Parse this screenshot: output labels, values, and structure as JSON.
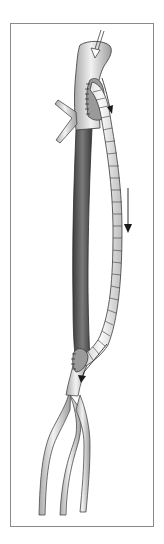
{
  "figure": {
    "parts": {
      "aortic_arch": "aortic-arch",
      "native_aorta": "native-descending-aorta",
      "graft": "ringed-bypass-graft",
      "proximal_anastomosis": "proximal-anastomosis",
      "distal_anastomosis": "distal-anastomosis",
      "iliac_arteries": "iliac-bifurcation",
      "branch": "arch-branch-vessel"
    },
    "arrows": [
      "inflow-arrow",
      "graft-flow-arrow-upper",
      "graft-flow-arrow-middle",
      "graft-flow-arrow-lower"
    ]
  },
  "colors": {
    "frame": "#8a8a8a",
    "vessel_fill": "#d8d8d8",
    "vessel_highlight": "#f4f4f4",
    "vessel_outline": "#4a4a4a",
    "native_aorta_fill": "#6a6a6a",
    "native_aorta_dark": "#3c3c3c",
    "graft_fill": "#e8e8e8",
    "arrow": "#1a1a1a"
  }
}
